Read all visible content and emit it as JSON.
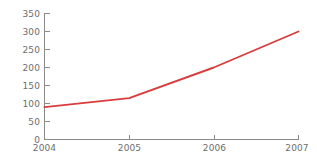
{
  "chart_data": {
    "type": "line",
    "title": "",
    "subtitle": "",
    "xlabel": "",
    "ylabel": "",
    "x": [
      "2004",
      "2005",
      "2006",
      "2007"
    ],
    "categories": [
      "2004",
      "2005",
      "2006",
      "2007"
    ],
    "values": [
      90,
      115,
      200,
      300
    ],
    "series": [
      {
        "name": "series-1",
        "color": "#d93c3c",
        "values": [
          90,
          115,
          200,
          300
        ]
      }
    ],
    "ylim": [
      0,
      350
    ],
    "y_ticks": [
      0,
      50,
      100,
      150,
      200,
      250,
      300,
      350
    ],
    "y_tick_labels": [
      "0",
      "50",
      "100",
      "150",
      "200",
      "250",
      "300",
      "350"
    ],
    "x_ticks": [
      "2004",
      "2005",
      "2006",
      "2007"
    ],
    "x_tick_labels": [
      "2004",
      "2005",
      "2006",
      "2007"
    ],
    "grid": false,
    "legend": false,
    "legend_position": "none",
    "annotations": []
  },
  "style": {
    "background": "#ffffff",
    "axis_color": "#8a8a8a",
    "tick_label_color": "#6e6e6e",
    "line_color": "#d93c3c"
  },
  "y_axis": {
    "label_0": "0",
    "label_50": "50",
    "label_100": "100",
    "label_150": "150",
    "label_200": "200",
    "label_250": "250",
    "label_300": "300",
    "label_350": "350"
  },
  "x_axis": {
    "label_2004": "2004",
    "label_2005": "2005",
    "label_2006": "2006",
    "label_2007": "2007"
  }
}
